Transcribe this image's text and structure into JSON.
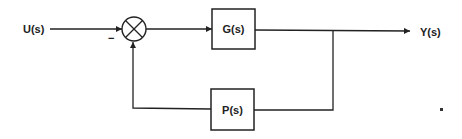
{
  "diagram": {
    "type": "feedback-control-block-diagram",
    "colors": {
      "line": "#222222",
      "background": "#ffffff"
    },
    "input": {
      "label": "U(s)"
    },
    "output": {
      "label": "Y(s)"
    },
    "summing_junction": {
      "symbol": "⊗",
      "feedback_sign": "−"
    },
    "forward_block": {
      "label": "G(s)"
    },
    "feedback_block": {
      "label": "P(s)"
    },
    "stray_mark": "."
  }
}
